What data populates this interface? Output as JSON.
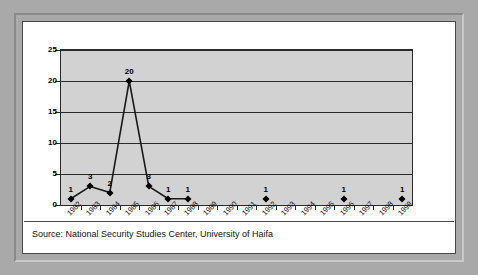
{
  "caption": "Source: National Security Studies Center, University of Haifa",
  "colors": {
    "outer_frame": "#a9a9a9",
    "panel": "#ffffff",
    "plot_area": "#d2d2d2",
    "gridline": "#2b2b2b",
    "marker": "#000000",
    "line": "#1a1a1a"
  },
  "chart_data": {
    "type": "line",
    "title": "",
    "subtitle": "",
    "xlabel": "",
    "ylabel": "",
    "ylim": [
      0,
      25
    ],
    "ytick_step": 5,
    "ytick_labels": [
      "0",
      "5",
      "10",
      "15",
      "20",
      "25"
    ],
    "grid": "horizontal",
    "legend": "none",
    "annotation": "Source: National Security Studies Center, University of Haifa",
    "categories": [
      "1982",
      "1983",
      "1984",
      "1985",
      "1986",
      "1987",
      "1988",
      "1989",
      "1990",
      "1991",
      "1992",
      "1993",
      "1994",
      "1995",
      "1996",
      "1997",
      "1998",
      "1999"
    ],
    "series": [
      {
        "name": "Incidents",
        "connected_range": [
          "1982",
          "1988"
        ],
        "values": [
          1,
          3,
          2,
          20,
          3,
          1,
          1,
          null,
          null,
          null,
          1,
          null,
          null,
          null,
          1,
          null,
          null,
          1
        ],
        "point_labels": [
          "1",
          "3",
          "2",
          "20",
          "3",
          "1",
          "1",
          "",
          "",
          "",
          "1",
          "",
          "",
          "",
          "1",
          "",
          "",
          "1"
        ]
      }
    ]
  }
}
